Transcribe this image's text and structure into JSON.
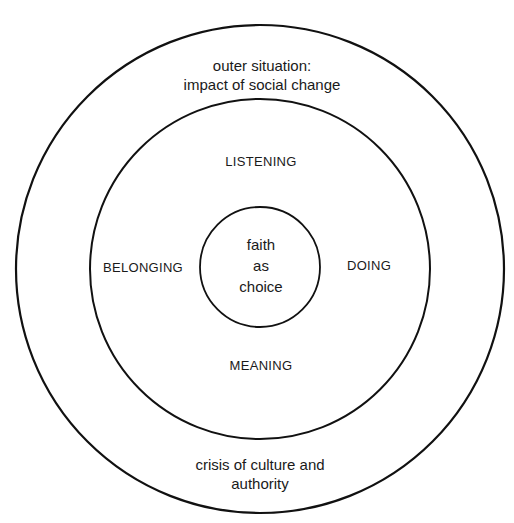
{
  "diagram": {
    "outer_ring": {
      "top_label_line1": "outer situation:",
      "top_label_line2": "impact of social change",
      "bottom_label_line1": "crisis of culture and",
      "bottom_label_line2": "authority"
    },
    "middle_ring": {
      "top": "LISTENING",
      "left": "BELONGING",
      "right": "DOING",
      "bottom": "MEANING"
    },
    "center": {
      "line1": "faith",
      "line2": "as",
      "line3": "choice"
    },
    "colors": {
      "stroke": "#111111",
      "background": "#ffffff"
    }
  }
}
